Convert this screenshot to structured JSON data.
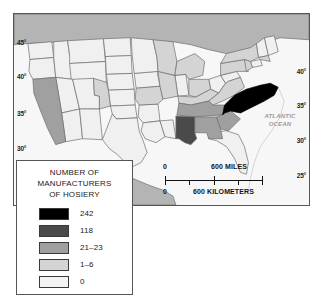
{
  "map": {
    "title_alt": "Number of hosiery manufacturers by state",
    "ocean_label_line1": "ATLANTIC",
    "ocean_label_line2": "OCEAN",
    "lat_labels_left": [
      "45°",
      "40°",
      "35°",
      "30°"
    ],
    "lat_labels_right": [
      "40°",
      "35°",
      "30°",
      "25°"
    ],
    "colors": {
      "level_242": "#000000",
      "level_118": "#4a4a4a",
      "level_21_23": "#a0a0a0",
      "level_1_6": "#d4d4d4",
      "level_0": "#f0f0f0",
      "neighbor_country": "#b4b4b4",
      "ocean": "#f7f7f7",
      "border": "#6d6d6d",
      "frame": "#555555"
    },
    "state_values": {
      "NC": 242,
      "AL": 118,
      "TN": 21,
      "GA": 22,
      "SC": 23,
      "CA": 21,
      "PA": 6,
      "NY": 4,
      "VA": 3,
      "WI": 2,
      "MI": 2,
      "NJ": 2,
      "OH": 2,
      "IL": 1,
      "MO": 1,
      "CO": 1,
      "MA": 1,
      "KY": 1
    }
  },
  "scale": {
    "miles_zero": "0",
    "miles_label": "600 MILES",
    "km_zero": "0",
    "km_label": "600 KILOMETERS"
  },
  "legend": {
    "title_line1": "NUMBER OF",
    "title_line2": "MANUFACTURERS",
    "title_line3": "OF HOSIERY",
    "items": [
      {
        "value": "242",
        "color": "#000000"
      },
      {
        "value": "118",
        "color": "#4a4a4a"
      },
      {
        "value": "21–23",
        "color": "#a0a0a0"
      },
      {
        "value": "1–6",
        "color": "#d4d4d4"
      },
      {
        "value": "0",
        "color": "#f4f4f4"
      }
    ]
  }
}
